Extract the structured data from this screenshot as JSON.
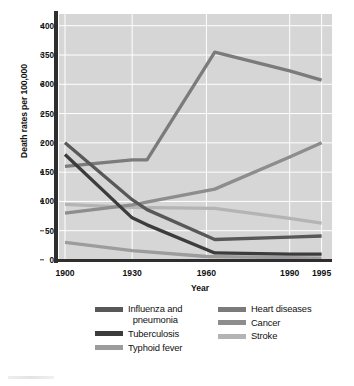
{
  "chart_data": {
    "type": "line",
    "title": "",
    "xlabel": "Year",
    "ylabel": "Death rates per 100,000",
    "x": [
      1900,
      1930,
      1960,
      1990,
      1995
    ],
    "xtick_labels": [
      "1900",
      "1930",
      "1960",
      "1990",
      "1995"
    ],
    "ytick_labels": [
      "0",
      "50",
      "100",
      "150",
      "200",
      "250",
      "300",
      "350",
      "400"
    ],
    "ytick_values": [
      0,
      50,
      100,
      150,
      200,
      250,
      300,
      350,
      400
    ],
    "ylim": [
      0,
      420
    ],
    "grid": true,
    "legend_position": "below",
    "plot_background": "#d6d6d6",
    "gridline_color": "#ffffff",
    "series": [
      {
        "name": "Influenza and pneumonia",
        "legend_label_line1": "Influenza and",
        "legend_label_line2": "pneumonia",
        "color": "#585858",
        "points": [
          {
            "year": 1900,
            "value": 200
          },
          {
            "year": 1930,
            "value": 103
          },
          {
            "year": 1936,
            "value": 86
          },
          {
            "year": 1963,
            "value": 35
          },
          {
            "year": 1990,
            "value": 39
          },
          {
            "year": 1995,
            "value": 41
          }
        ]
      },
      {
        "name": "Tuberculosis",
        "legend_label_line1": "Tuberculosis",
        "legend_label_line2": "",
        "color": "#3c3c3c",
        "points": [
          {
            "year": 1900,
            "value": 180
          },
          {
            "year": 1930,
            "value": 72
          },
          {
            "year": 1936,
            "value": 60
          },
          {
            "year": 1963,
            "value": 12
          },
          {
            "year": 1990,
            "value": 10
          },
          {
            "year": 1995,
            "value": 10
          }
        ]
      },
      {
        "name": "Typhoid fever",
        "legend_label_line1": "Typhoid fever",
        "legend_label_line2": "",
        "color": "#9c9c9c",
        "points": [
          {
            "year": 1900,
            "value": 30
          },
          {
            "year": 1930,
            "value": 16
          },
          {
            "year": 1960,
            "value": 6
          },
          {
            "year": 1990,
            "value": 4
          },
          {
            "year": 1995,
            "value": 3
          }
        ]
      },
      {
        "name": "Heart diseases",
        "legend_label_line1": "Heart diseases",
        "legend_label_line2": "",
        "color": "#7b7b7b",
        "points": [
          {
            "year": 1900,
            "value": 160
          },
          {
            "year": 1930,
            "value": 171
          },
          {
            "year": 1936,
            "value": 171
          },
          {
            "year": 1963,
            "value": 355
          },
          {
            "year": 1990,
            "value": 323
          },
          {
            "year": 1995,
            "value": 307
          }
        ]
      },
      {
        "name": "Cancer",
        "legend_label_line1": "Cancer",
        "legend_label_line2": "",
        "color": "#8d8d8d",
        "points": [
          {
            "year": 1900,
            "value": 80
          },
          {
            "year": 1930,
            "value": 94
          },
          {
            "year": 1963,
            "value": 121
          },
          {
            "year": 1990,
            "value": 176
          },
          {
            "year": 1995,
            "value": 200
          }
        ]
      },
      {
        "name": "Stroke",
        "legend_label_line1": "Stroke",
        "legend_label_line2": "",
        "color": "#b4b4b4",
        "points": [
          {
            "year": 1900,
            "value": 95
          },
          {
            "year": 1930,
            "value": 90
          },
          {
            "year": 1963,
            "value": 88
          },
          {
            "year": 1990,
            "value": 71
          },
          {
            "year": 1995,
            "value": 63
          }
        ]
      }
    ],
    "legend_left": [
      {
        "name": "Influenza and pneumonia",
        "line1": "Influenza and",
        "line2": "pneumonia",
        "color": "#585858"
      },
      {
        "name": "Tuberculosis",
        "line1": "Tuberculosis",
        "line2": "",
        "color": "#3c3c3c"
      },
      {
        "name": "Typhoid fever",
        "line1": "Typhoid fever",
        "line2": "",
        "color": "#9c9c9c"
      }
    ],
    "legend_right": [
      {
        "name": "Heart diseases",
        "line1": "Heart diseases",
        "line2": "",
        "color": "#7b7b7b"
      },
      {
        "name": "Cancer",
        "line1": "Cancer",
        "line2": "",
        "color": "#8d8d8d"
      },
      {
        "name": "Stroke",
        "line1": "Stroke",
        "line2": "",
        "color": "#b4b4b4"
      }
    ]
  }
}
